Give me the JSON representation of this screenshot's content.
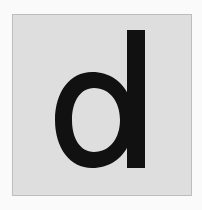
{
  "card": {
    "letter": "d",
    "background_color": "#dedede",
    "border_color": "#bdbdbd",
    "letter_color": "#111111"
  },
  "page": {
    "background_color": "#fafafa"
  }
}
